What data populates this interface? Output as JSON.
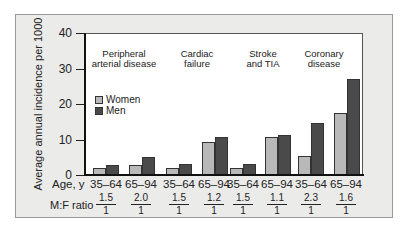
{
  "chart_data": {
    "type": "bar",
    "title": "",
    "ylabel": "Average annual incidence per 1000",
    "xlabel": "Age, y",
    "ylim": [
      0,
      40
    ],
    "yticks": [
      0,
      10,
      20,
      30,
      40
    ],
    "grid": false,
    "legend": {
      "position": "upper-left-inside",
      "entries": [
        "Women",
        "Men"
      ]
    },
    "groups": [
      {
        "name": "Peripheral arterial disease",
        "title_lines": [
          "Peripheral",
          "arterial disease"
        ],
        "categories": [
          "35–64",
          "65–94"
        ],
        "women": [
          2.0,
          2.7
        ],
        "men": [
          2.8,
          5.2
        ],
        "mf_ratio": [
          "1.5",
          "2.0"
        ]
      },
      {
        "name": "Cardiac failure",
        "title_lines": [
          "Cardiac",
          "failure"
        ],
        "categories": [
          "35–64",
          "65–94"
        ],
        "women": [
          2.0,
          9.2
        ],
        "men": [
          3.0,
          10.8
        ],
        "mf_ratio": [
          "1.5",
          "1.2"
        ]
      },
      {
        "name": "Stroke and TIA",
        "title_lines": [
          "Stroke",
          "and TIA"
        ],
        "categories": [
          "35–64",
          "65–94"
        ],
        "women": [
          1.9,
          10.8
        ],
        "men": [
          3.0,
          11.4
        ],
        "mf_ratio": [
          "1.5",
          "1.1"
        ]
      },
      {
        "name": "Coronary disease",
        "title_lines": [
          "Coronary",
          "disease"
        ],
        "categories": [
          "35–64",
          "65–94"
        ],
        "women": [
          5.4,
          17.4
        ],
        "men": [
          14.6,
          27.0
        ],
        "mf_ratio": [
          "2.3",
          "1.6"
        ]
      }
    ],
    "series": [
      {
        "name": "Women",
        "color": "#b9b9b9",
        "values": [
          2.0,
          2.7,
          2.0,
          9.2,
          1.9,
          10.8,
          5.4,
          17.4
        ]
      },
      {
        "name": "Men",
        "color": "#4a4a4a",
        "values": [
          2.8,
          5.2,
          3.0,
          10.8,
          3.0,
          11.4,
          14.6,
          27.0
        ]
      }
    ],
    "categories": [
      "35–64",
      "65–94",
      "35–64",
      "65–94",
      "35–64",
      "65–94",
      "35–64",
      "65–94"
    ],
    "mf_ratio_label": "M:F ratio",
    "mf_ratio_denominator": "1"
  },
  "labels": {
    "ylabel": "Average annual incidence per 1000",
    "xlabel": "Age, y",
    "ratio_label": "M:F ratio",
    "legend_women": "Women",
    "legend_men": "Men",
    "yticks": [
      "0",
      "10",
      "20",
      "30",
      "40"
    ],
    "g0_l1": "Peripheral",
    "g0_l2": "arterial disease",
    "g1_l1": "Cardiac",
    "g1_l2": "failure",
    "g2_l1": "Stroke",
    "g2_l2": "and TIA",
    "g3_l1": "Coronary",
    "g3_l2": "disease",
    "ages": [
      "35–64",
      "65–94",
      "35–64",
      "65–94",
      "35–64",
      "65–94",
      "35–64",
      "65–94"
    ],
    "ratios": [
      "1.5",
      "2.0",
      "1.5",
      "1.2",
      "1.5",
      "1.1",
      "2.3",
      "1.6"
    ],
    "den": "1"
  }
}
